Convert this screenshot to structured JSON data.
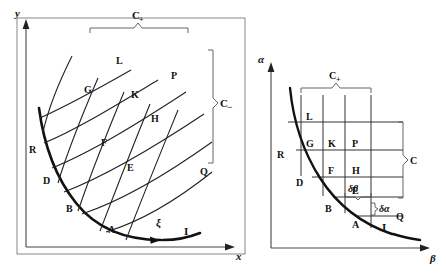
{
  "figure": {
    "caption": "",
    "panels": [
      {
        "id": "left-panel",
        "axes": {
          "x_label": "x",
          "y_label": "y"
        },
        "brace_top_label": "C+",
        "bracket_right_label": "C−",
        "curve_label": "I",
        "direction_label": "ξ",
        "points": [
          "L",
          "P",
          "K",
          "G",
          "H",
          "F",
          "E",
          "R",
          "D",
          "B",
          "A",
          "Q"
        ]
      },
      {
        "id": "right-panel",
        "axes": {
          "x_label": "β",
          "y_label": "α"
        },
        "brace_top_label": "C+",
        "bracket_right_label": "C",
        "curve_label": "I",
        "step_labels": {
          "dbeta": "δβ",
          "dalpha": "δα"
        },
        "points": [
          "L",
          "G",
          "K",
          "P",
          "R",
          "F",
          "H",
          "D",
          "E",
          "B",
          "A",
          "Q"
        ]
      }
    ],
    "labels": {
      "y": "y",
      "x": "x",
      "alpha": "α",
      "beta": "β",
      "Cplus": "C",
      "Cplus_sub": "+",
      "Cminus": "C",
      "Cminus_sub": "−",
      "C": "C",
      "I": "I",
      "xi": "ξ",
      "deltabeta": "δβ",
      "deltaalpha": "δα",
      "A": "A",
      "B": "B",
      "D": "D",
      "E": "E",
      "F": "F",
      "G": "G",
      "H": "H",
      "K": "K",
      "L": "L",
      "P": "P",
      "Q": "Q",
      "R": "R"
    },
    "colors": {
      "ink": "#1a1a1a",
      "thin": "#333333",
      "background": "#ffffff"
    }
  }
}
